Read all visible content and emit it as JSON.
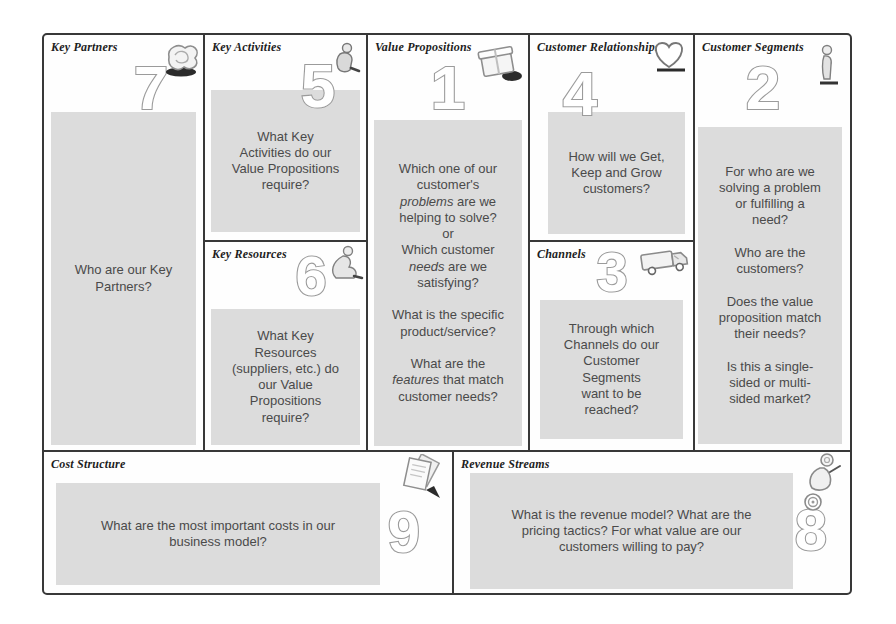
{
  "colors": {
    "note_bg": "#dcdcdc",
    "border": "#383838",
    "body_text": "#4a4a4a",
    "label_text": "#1d1d1d",
    "number_fill": "#ffffff",
    "number_stroke": "#9b9b9b"
  },
  "sections": {
    "key_partners": {
      "label": "Key Partners",
      "number": "7",
      "icon": "knot-icon",
      "note": "Who are our Key\nPartners?"
    },
    "key_activities": {
      "label": "Key Activities",
      "number": "5",
      "icon": "person-working-icon",
      "note": "What Key\nActivities do our\nValue Propositions\nrequire?"
    },
    "key_resources": {
      "label": "Key Resources",
      "number": "6",
      "icon": "statue-figure-icon",
      "note": "What Key\nResources\n(suppliers, etc.) do\nour Value\nPropositions\nrequire?"
    },
    "value_propositions": {
      "label": "Value Propositions",
      "number": "1",
      "icon": "gift-box-icon",
      "note_segments": [
        {
          "text": "Which one of our\ncustomer's\n",
          "italic": false
        },
        {
          "text": "problems",
          "italic": true
        },
        {
          "text": " are we\nhelping to solve?\nor\nWhich customer\n",
          "italic": false
        },
        {
          "text": "needs",
          "italic": true
        },
        {
          "text": " are we\nsatisfying?\n\nWhat is the specific\nproduct/service?\n\nWhat are the\n",
          "italic": false
        },
        {
          "text": "features",
          "italic": true
        },
        {
          "text": " that match\ncustomer needs?",
          "italic": false
        }
      ]
    },
    "customer_relationships": {
      "label": "Customer Relationships",
      "number": "4",
      "icon": "heart-icon",
      "note": "How will we Get,\nKeep and Grow\ncustomers?"
    },
    "channels": {
      "label": "Channels",
      "number": "3",
      "icon": "delivery-truck-icon",
      "note": "Through which\nChannels do our\nCustomer\nSegments\nwant to be\nreached?"
    },
    "customer_segments": {
      "label": "Customer Segments",
      "number": "2",
      "icon": "person-icon",
      "note": "For who are we\nsolving a problem\nor fulfilling a\nneed?\n\nWho are the\ncustomers?\n\nDoes the value\nproposition match\ntheir needs?\n\nIs this a single-\nsided or multi-\nsided market?"
    },
    "cost_structure": {
      "label": "Cost Structure",
      "number": "9",
      "icon": "paper-notes-icon",
      "note": "What are the most important costs in our\nbusiness model?"
    },
    "revenue_streams": {
      "label": "Revenue Streams",
      "number": "8",
      "icon": "money-bag-icon",
      "note": "What is the revenue model? What are the\npricing tactics? For what value are our\ncustomers willing to pay?"
    }
  }
}
